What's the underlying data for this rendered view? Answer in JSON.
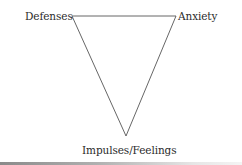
{
  "diagram": {
    "type": "triangle-of-conflict",
    "vertices": {
      "top_left": {
        "label": "Defenses",
        "x": 72,
        "y": 16
      },
      "top_right": {
        "label": "Anxiety",
        "x": 176,
        "y": 16
      },
      "bottom": {
        "label": "Impulses/Feelings",
        "x": 126,
        "y": 136
      }
    },
    "edges": [
      {
        "from": "Defenses",
        "to": "Anxiety"
      },
      {
        "from": "Anxiety",
        "to": "Impulses/Feelings"
      },
      {
        "from": "Impulses/Feelings",
        "to": "Defenses"
      }
    ],
    "line_color": "#555555",
    "text_color": "#2b2b2b"
  },
  "labels": {
    "defenses": "Defenses",
    "anxiety": "Anxiety",
    "impulses": "Impulses/Feelings"
  }
}
